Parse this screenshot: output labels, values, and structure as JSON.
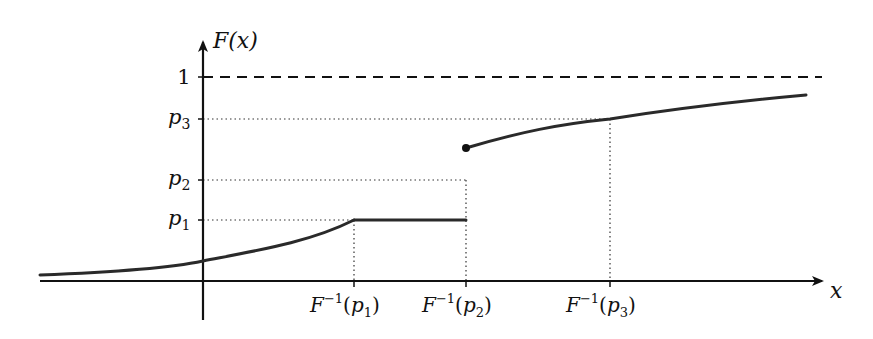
{
  "chart_data": {
    "type": "line",
    "title": "",
    "xlabel": "x",
    "ylabel": "F(x)",
    "y_ticks": [
      {
        "key": "p1",
        "label": "p",
        "sub": "1"
      },
      {
        "key": "p2",
        "label": "p",
        "sub": "2"
      },
      {
        "key": "p3",
        "label": "p",
        "sub": "3"
      },
      {
        "key": "one",
        "label": "1",
        "sub": ""
      }
    ],
    "x_ticks": [
      {
        "key": "q1",
        "label": "F",
        "sup": "−1",
        "arg": "p",
        "sub": "1"
      },
      {
        "key": "q2",
        "label": "F",
        "sup": "−1",
        "arg": "p",
        "sub": "2"
      },
      {
        "key": "q3",
        "label": "F",
        "sup": "−1",
        "arg": "p",
        "sub": "3"
      }
    ],
    "levels": {
      "p1": 0.35,
      "p2": 0.5,
      "p3": 0.75,
      "one": 1.0
    },
    "jump_value": 0.63,
    "segments": [
      {
        "name": "increasing-left",
        "from": "-inf",
        "to": "F^-1(p1)",
        "description": "smooth increasing curve approaching 0 at left, reaching p1 at F^-1(p1)"
      },
      {
        "name": "flat",
        "from": "F^-1(p1)",
        "to": "F^-1(p2)",
        "value": "p1",
        "description": "constant at p1"
      },
      {
        "name": "jump",
        "at": "F^-1(p2)",
        "from_value": "p1",
        "to_value": 0.63,
        "description": "discontinuity; closed dot at upper value"
      },
      {
        "name": "increasing-right",
        "from": "F^-1(p2)",
        "to": "+inf",
        "description": "concave increasing curve through p3 at F^-1(p3), approaching 1"
      }
    ],
    "asymptote": {
      "value": 1,
      "style": "dashed"
    },
    "guides": "dotted"
  }
}
